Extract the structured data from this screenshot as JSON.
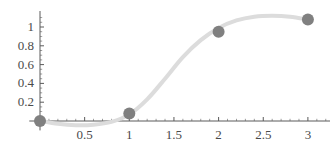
{
  "chart_data": {
    "type": "scatter",
    "title": "",
    "xlabel": "",
    "ylabel": "",
    "xlim": [
      -0.12,
      3.25
    ],
    "ylim": [
      -0.12,
      1.2
    ],
    "grid": false,
    "legend": null,
    "x_ticks": [
      0.5,
      1,
      1.5,
      2,
      2.5,
      3
    ],
    "x_tick_labels": [
      "0.5",
      "1",
      "1.5",
      "2",
      "2.5",
      "3"
    ],
    "y_ticks": [
      0.2,
      0.4,
      0.6,
      0.8,
      1
    ],
    "y_tick_labels": [
      "0.2",
      "0.4",
      "0.6",
      "0.8",
      "1"
    ],
    "x_minor_tick_step": 0.1,
    "y_minor_tick_step": 0.05,
    "series": [
      {
        "name": "data points",
        "type": "scatter",
        "marker": "circle",
        "marker_radius_px": 6,
        "color": "#808080",
        "x": [
          0,
          1,
          2,
          3
        ],
        "y": [
          0,
          0.08,
          0.95,
          1.08
        ]
      },
      {
        "name": "fitted curve",
        "type": "line",
        "color": "#dcdcdc",
        "line_width_px": 4,
        "x": [
          0,
          0.2,
          0.4,
          0.6,
          0.8,
          1,
          1.2,
          1.4,
          1.6,
          1.8,
          2,
          2.2,
          2.4,
          2.6,
          2.8,
          3
        ],
        "y": [
          0,
          -0.03,
          -0.045,
          -0.04,
          -0.01,
          0.07,
          0.23,
          0.45,
          0.68,
          0.86,
          0.99,
          1.07,
          1.11,
          1.12,
          1.11,
          1.08
        ]
      }
    ],
    "axis_color": "#5a5a5a",
    "background": "#ffffff"
  },
  "axes": {
    "x_axis_name": "x-axis",
    "y_axis_name": "y-axis"
  }
}
